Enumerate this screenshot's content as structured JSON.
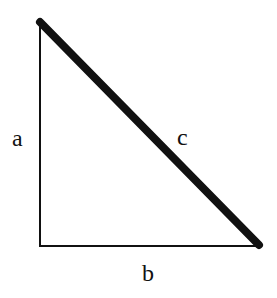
{
  "diagram": {
    "type": "right-triangle",
    "labels": {
      "a": "a",
      "b": "b",
      "c": "c"
    },
    "vertices": {
      "top": [
        40,
        22
      ],
      "bottom_left": [
        40,
        246
      ],
      "bottom_right": [
        259,
        246
      ]
    },
    "colors": {
      "stroke": "#111111",
      "background": "#ffffff"
    },
    "stroke_widths": {
      "legs": 2,
      "hypotenuse": 8
    }
  }
}
